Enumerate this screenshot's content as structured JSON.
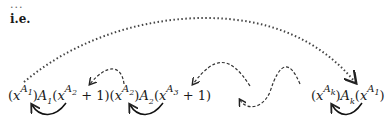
{
  "document": {
    "lead_dots": "...",
    "label": "i.e.",
    "formula_left": {
      "terms": [
        {
          "open": "(",
          "base": "x",
          "sup_base": "A",
          "sup_sub": "1",
          "close": ")"
        },
        {
          "coef": "A",
          "coef_sub": "1"
        },
        {
          "open": "(",
          "base": "x",
          "sup_base": "A",
          "sup_sub": "2",
          "tail": " + 1)"
        },
        {
          "open": "(",
          "base": "x",
          "sup_base": "A",
          "sup_sub": "2",
          "close": ")"
        },
        {
          "coef": "A",
          "coef_sub": "2"
        },
        {
          "open": "(",
          "base": "x",
          "sup_base": "A",
          "sup_sub": "3",
          "tail": " + 1)"
        }
      ]
    },
    "formula_right": {
      "terms": [
        {
          "open": "(",
          "base": "x",
          "sup_base": "A",
          "sup_sub": "k",
          "close": ")"
        },
        {
          "coef": "A",
          "coef_sub": "k"
        },
        {
          "open": "(",
          "base": "x",
          "sup_base": "A",
          "sup_sub": "1",
          "close": ")"
        }
      ]
    },
    "arrows": {
      "long_dotted": "from (x^A1) to (x^A1) at end",
      "solid_loops": 3,
      "dashed_hops": 4
    },
    "colors": {
      "ink": "#1a1a1a",
      "dotted": "#444444"
    }
  }
}
